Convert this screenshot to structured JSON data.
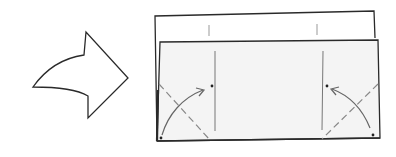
{
  "diagram": {
    "type": "origami-fold-step",
    "colors": {
      "background": "#ffffff",
      "outline": "#2a2a2a",
      "paper_back": "#ffffff",
      "paper_front": "#f4f4f4",
      "crease": "#777777",
      "dash": "#888888",
      "arrow_curve": "#666666",
      "dot": "#222222"
    },
    "icons": {
      "step_arrow": "curved-right-arrow",
      "fold_arrows": [
        "curved-fold-arrow-left-corner",
        "curved-fold-arrow-right-corner"
      ]
    }
  }
}
